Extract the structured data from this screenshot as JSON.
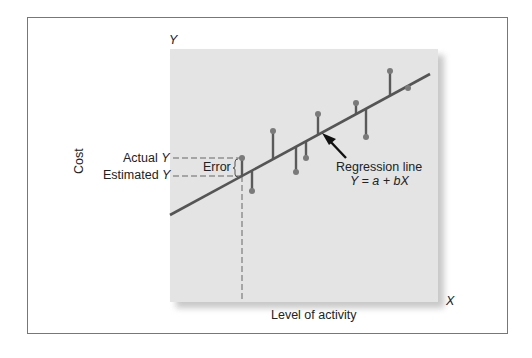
{
  "labels": {
    "y_axis_letter": "Y",
    "x_axis_letter": "X",
    "y_axis_title": "Cost",
    "x_axis_title": "Level of activity",
    "actual_y": "Actual",
    "estimated_y": "Estimated",
    "y_var": "Y",
    "error": "Error",
    "regression_line": "Regression line",
    "equation": "Y = a + bX"
  },
  "colors": {
    "plot_bg": "#e4e4e4",
    "line": "#555555",
    "points": "#7a7a7a",
    "frame": "#777777"
  },
  "chart_data": {
    "type": "scatter",
    "title": "",
    "xlabel": "Level of activity",
    "ylabel": "Cost",
    "grid": false,
    "legend": "none",
    "regression_line": {
      "equation": "Y = a + bX",
      "from": [
        170,
        215
      ],
      "to": [
        430,
        74
      ]
    },
    "points": [
      {
        "x": 242,
        "actual": 158,
        "estimated": 176,
        "highlighted": true
      },
      {
        "x": 252,
        "actual": 191,
        "estimated": 171
      },
      {
        "x": 273,
        "actual": 131,
        "estimated": 159
      },
      {
        "x": 296,
        "actual": 172,
        "estimated": 147
      },
      {
        "x": 306,
        "actual": 158,
        "estimated": 141
      },
      {
        "x": 318,
        "actual": 114,
        "estimated": 135
      },
      {
        "x": 356,
        "actual": 103,
        "estimated": 114
      },
      {
        "x": 366,
        "actual": 137,
        "estimated": 109
      },
      {
        "x": 390,
        "actual": 71,
        "estimated": 96
      },
      {
        "x": 408,
        "actual": 88,
        "estimated": 86
      }
    ],
    "annotations": [
      "Actual Y",
      "Estimated Y",
      "Error",
      "Regression line",
      "Y = a + bX"
    ]
  }
}
